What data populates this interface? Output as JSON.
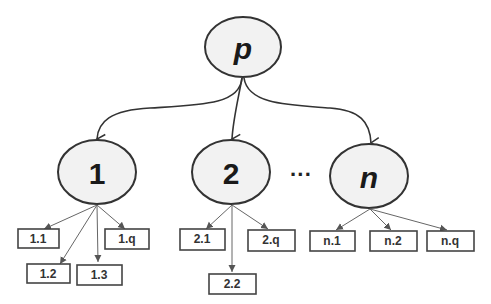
{
  "diagram": {
    "type": "tree",
    "root": {
      "label": "p",
      "italic": true
    },
    "children": [
      {
        "label": "1",
        "italic": false,
        "leaves": [
          "1.1",
          "1.2",
          "1.3",
          "1.q"
        ]
      },
      {
        "label": "2",
        "italic": false,
        "leaves": [
          "2.1",
          "2.2",
          "2.q"
        ]
      },
      {
        "label": "n",
        "italic": true,
        "leaves": [
          "n.1",
          "n.2",
          "n.q"
        ]
      }
    ],
    "ellipsis": "···"
  },
  "colors": {
    "ellipse_fill": "#f2f2f2",
    "stroke": "#333333",
    "background": "#ffffff"
  }
}
